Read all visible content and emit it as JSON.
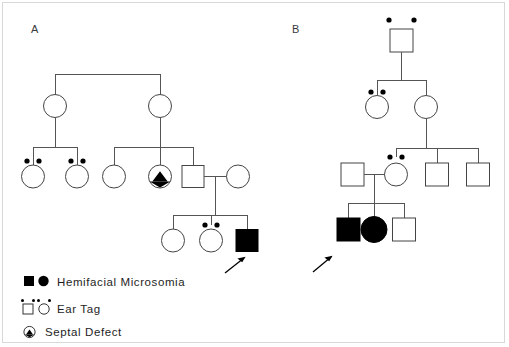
{
  "figure": {
    "width": 509,
    "height": 347,
    "background": "#ffffff",
    "border_color": "#d8d8d8",
    "line_color": "#555555",
    "symbol_stroke": "#444444",
    "affected_fill": "#000000"
  },
  "panels": [
    {
      "id": "A",
      "label": "A"
    },
    {
      "id": "B",
      "label": "B"
    }
  ],
  "legend": {
    "items": [
      {
        "symbols": [
          "filled-square",
          "filled-circle"
        ],
        "label": "Hemifacial Microsomia"
      },
      {
        "symbols": [
          "square-with-ear-tags",
          "circle-with-ear-tags"
        ],
        "label": "Ear Tag"
      },
      {
        "symbols": [
          "circle-with-wedge"
        ],
        "label": "Septal Defect"
      }
    ]
  },
  "pedigree_a": {
    "generations": [
      {
        "id": "A-I",
        "individuals": [
          {
            "id": "A-I-1",
            "sex": "female",
            "shape": "circle",
            "affected": false,
            "ear_tags": 0,
            "septal_defect": false,
            "proband": false
          },
          {
            "id": "A-I-2",
            "sex": "female",
            "shape": "circle",
            "affected": false,
            "ear_tags": 0,
            "septal_defect": false,
            "proband": false
          }
        ]
      },
      {
        "id": "A-II",
        "individuals": [
          {
            "id": "A-II-1",
            "sex": "female",
            "shape": "circle",
            "affected": false,
            "ear_tags": 2,
            "septal_defect": false,
            "proband": false
          },
          {
            "id": "A-II-2",
            "sex": "female",
            "shape": "circle",
            "affected": false,
            "ear_tags": 2,
            "septal_defect": false,
            "proband": false
          },
          {
            "id": "A-II-3",
            "sex": "female",
            "shape": "circle",
            "affected": false,
            "ear_tags": 0,
            "septal_defect": false,
            "proband": false
          },
          {
            "id": "A-II-4",
            "sex": "female",
            "shape": "circle",
            "affected": false,
            "ear_tags": 0,
            "septal_defect": true,
            "proband": false
          },
          {
            "id": "A-II-5",
            "sex": "male",
            "shape": "square",
            "affected": false,
            "ear_tags": 0,
            "septal_defect": false,
            "proband": false
          },
          {
            "id": "A-II-6",
            "sex": "female",
            "shape": "circle",
            "affected": false,
            "ear_tags": 0,
            "septal_defect": false,
            "proband": false
          }
        ]
      },
      {
        "id": "A-III",
        "individuals": [
          {
            "id": "A-III-1",
            "sex": "female",
            "shape": "circle",
            "affected": false,
            "ear_tags": 0,
            "septal_defect": false,
            "proband": false
          },
          {
            "id": "A-III-2",
            "sex": "female",
            "shape": "circle",
            "affected": false,
            "ear_tags": 2,
            "septal_defect": false,
            "proband": false
          },
          {
            "id": "A-III-3",
            "sex": "male",
            "shape": "square",
            "affected": true,
            "ear_tags": 0,
            "septal_defect": false,
            "proband": true
          }
        ]
      }
    ]
  },
  "pedigree_b": {
    "generations": [
      {
        "id": "B-I",
        "individuals": [
          {
            "id": "B-I-1",
            "sex": "male",
            "shape": "square",
            "affected": false,
            "ear_tags": 2,
            "septal_defect": false,
            "proband": false
          }
        ]
      },
      {
        "id": "B-II",
        "individuals": [
          {
            "id": "B-II-1",
            "sex": "female",
            "shape": "circle",
            "affected": false,
            "ear_tags": 2,
            "septal_defect": false,
            "proband": false
          },
          {
            "id": "B-II-2",
            "sex": "female",
            "shape": "circle",
            "affected": false,
            "ear_tags": 0,
            "septal_defect": false,
            "proband": false
          }
        ]
      },
      {
        "id": "B-III",
        "individuals": [
          {
            "id": "B-III-1",
            "sex": "male",
            "shape": "square",
            "affected": false,
            "ear_tags": 0,
            "septal_defect": false,
            "proband": false
          },
          {
            "id": "B-III-2",
            "sex": "female",
            "shape": "circle",
            "affected": false,
            "ear_tags": 2,
            "septal_defect": false,
            "proband": false
          },
          {
            "id": "B-III-3",
            "sex": "male",
            "shape": "square",
            "affected": false,
            "ear_tags": 0,
            "septal_defect": false,
            "proband": false
          },
          {
            "id": "B-III-4",
            "sex": "male",
            "shape": "square",
            "affected": false,
            "ear_tags": 0,
            "septal_defect": false,
            "proband": false
          }
        ]
      },
      {
        "id": "B-IV",
        "individuals": [
          {
            "id": "B-IV-1",
            "sex": "male",
            "shape": "square",
            "affected": true,
            "ear_tags": 0,
            "septal_defect": false,
            "proband": true
          },
          {
            "id": "B-IV-2",
            "sex": "female",
            "shape": "circle",
            "affected": true,
            "ear_tags": 0,
            "septal_defect": false,
            "proband": false
          },
          {
            "id": "B-IV-3",
            "sex": "male",
            "shape": "square",
            "affected": false,
            "ear_tags": 0,
            "septal_defect": false,
            "proband": false
          }
        ]
      }
    ]
  }
}
